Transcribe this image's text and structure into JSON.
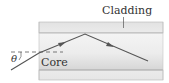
{
  "diagram": {
    "labels": {
      "cladding": "Cladding",
      "core": "Core",
      "angle": "θ"
    },
    "colors": {
      "cladding_fill": "#e4e4e4",
      "core_fill_top": "#f2f2f2",
      "core_fill_bottom": "#d9d9d9",
      "boundary": "#9a9a9a",
      "ray": "#555555",
      "text": "#333333",
      "dashed_normal": "#444444"
    }
  }
}
